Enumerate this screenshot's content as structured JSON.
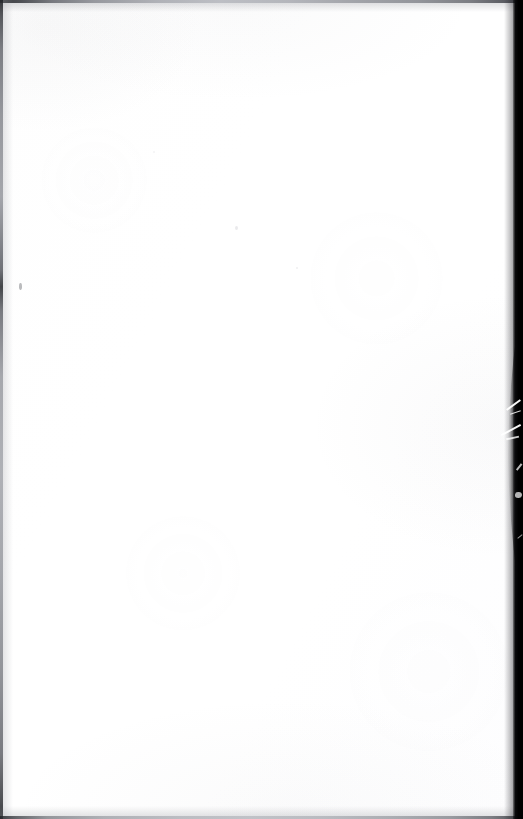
{
  "page": {
    "kind": "scanned-blank-page",
    "width": 523,
    "height": 819,
    "caption": "",
    "visible_text": "",
    "paper_color": "#ffffff",
    "background_color": "#ffffff"
  },
  "artifacts": {
    "top_edge": {
      "name": "top-scan-edge",
      "color": "#2e3034",
      "description": ""
    },
    "left_edge": {
      "name": "left-scan-edge",
      "color": "#24262a",
      "description": ""
    },
    "bottom_edge": {
      "name": "bottom-scan-edge",
      "color": "#26282c",
      "description": ""
    },
    "right_gutter": {
      "name": "right-gutter-shadow",
      "color": "#000000",
      "description": ""
    },
    "scratches": {
      "name": "gutter-scratch-marks",
      "color": "#ffffff",
      "count": 7
    },
    "flecks": {
      "name": "paper-flecks",
      "color": "#96989f",
      "count": 4
    }
  }
}
